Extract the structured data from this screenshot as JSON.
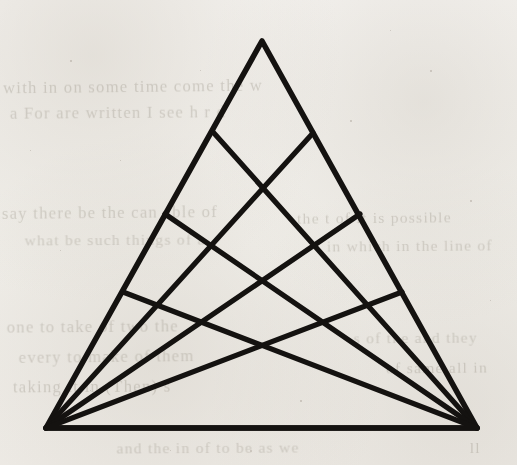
{
  "figure": {
    "title": "Geometric line figure",
    "medium": "scanned book page",
    "ink_color": "#141210",
    "paper_color": "#f3f1ee",
    "canvas": {
      "width": 517,
      "height": 465
    },
    "stroke_width_px": 5.2
  },
  "geometry": {
    "vertices": {
      "apex": {
        "label": "apex",
        "x": 262,
        "y": 41
      },
      "bottom_left": {
        "label": "bottom-left",
        "x": 46,
        "y": 428
      },
      "bottom_right": {
        "label": "bottom-right",
        "x": 477,
        "y": 428
      }
    },
    "outline_path": "M262,41 L477,428 L46,428 Z",
    "left_edge_nodes": [
      {
        "name": "L1",
        "x": 213,
        "y": 132
      },
      {
        "name": "L2",
        "x": 165,
        "y": 214
      },
      {
        "name": "L3",
        "x": 123,
        "y": 292
      }
    ],
    "right_edge_nodes": [
      {
        "name": "R1",
        "x": 313,
        "y": 133
      },
      {
        "name": "R2",
        "x": 360,
        "y": 214
      },
      {
        "name": "R3",
        "x": 402,
        "y": 292
      }
    ],
    "axis_crossings": [
      {
        "name": "X1",
        "x": 262,
        "y": 190
      },
      {
        "name": "X2",
        "x": 262,
        "y": 283
      },
      {
        "name": "X3",
        "x": 261,
        "y": 344
      }
    ],
    "cevians_from_bottom_left": [
      {
        "name": "BL-to-R1",
        "from": "bottom_left",
        "to": "R1",
        "x1": 46,
        "y1": 428,
        "x2": 313,
        "y2": 133
      },
      {
        "name": "BL-to-R2",
        "from": "bottom_left",
        "to": "R2",
        "x1": 46,
        "y1": 428,
        "x2": 360,
        "y2": 214
      },
      {
        "name": "BL-to-R3",
        "from": "bottom_left",
        "to": "R3",
        "x1": 46,
        "y1": 428,
        "x2": 402,
        "y2": 292
      },
      {
        "name": "BL-to-BR",
        "from": "bottom_left",
        "to": "bottom_right",
        "x1": 46,
        "y1": 428,
        "x2": 477,
        "y2": 428
      }
    ],
    "cevians_from_bottom_right": [
      {
        "name": "BR-to-L1",
        "from": "bottom_right",
        "to": "L1",
        "x1": 477,
        "y1": 428,
        "x2": 213,
        "y2": 132
      },
      {
        "name": "BR-to-L2",
        "from": "bottom_right",
        "to": "L2",
        "x1": 477,
        "y1": 428,
        "x2": 165,
        "y2": 214
      },
      {
        "name": "BR-to-L3",
        "from": "bottom_right",
        "to": "L3",
        "x1": 477,
        "y1": 428,
        "x2": 123,
        "y2": 292
      },
      {
        "name": "BR-to-BL",
        "from": "bottom_right",
        "to": "bottom_left",
        "x1": 477,
        "y1": 428,
        "x2": 46,
        "y2": 428
      }
    ],
    "counts": {
      "total_lines": 9,
      "cevians_per_vertex": 3,
      "edge_nodes_per_side": 3
    }
  },
  "background_text": {
    "note": "faint show-through handwriting from the reverse side of the page",
    "lines": [
      {
        "text": "with in on some time come the w",
        "x": 8,
        "y": 78,
        "rotate": -0.6,
        "size": 16
      },
      {
        "text": "a For are written I see h r d",
        "x": 14,
        "y": 104,
        "rotate": -0.4,
        "size": 16
      },
      {
        "text": "say there be the can able of",
        "x": 6,
        "y": 204,
        "rotate": -0.5,
        "size": 16
      },
      {
        "text": "what be such things of a",
        "x": 28,
        "y": 232,
        "rotate": -0.3,
        "size": 15
      },
      {
        "text": "the t of it is possible",
        "x": 300,
        "y": 210,
        "rotate": -0.5,
        "size": 15
      },
      {
        "text": "in which in the line of",
        "x": 330,
        "y": 238,
        "rotate": -0.4,
        "size": 15
      },
      {
        "text": "one to take of two the",
        "x": 10,
        "y": 318,
        "rotate": -0.4,
        "size": 16
      },
      {
        "text": "every to make of them",
        "x": 22,
        "y": 348,
        "rotate": -0.6,
        "size": 16
      },
      {
        "text": "taking it in (Then) s",
        "x": 16,
        "y": 378,
        "rotate": -0.3,
        "size": 16
      },
      {
        "text": "s of the and they",
        "x": 356,
        "y": 330,
        "rotate": -0.4,
        "size": 15
      },
      {
        "text": "of same all in",
        "x": 388,
        "y": 360,
        "rotate": -0.5,
        "size": 15
      },
      {
        "text": "and the in of to be as we",
        "x": 120,
        "y": 440,
        "rotate": -0.3,
        "size": 15
      },
      {
        "text": "ll",
        "x": 470,
        "y": 440,
        "rotate": 0,
        "size": 15
      }
    ]
  },
  "specks": [
    {
      "x": 70,
      "y": 60,
      "size": 2
    },
    {
      "x": 430,
      "y": 70,
      "size": 2
    },
    {
      "x": 120,
      "y": 160,
      "size": 1
    },
    {
      "x": 350,
      "y": 120,
      "size": 2
    },
    {
      "x": 60,
      "y": 250,
      "size": 1
    },
    {
      "x": 470,
      "y": 200,
      "size": 2
    },
    {
      "x": 200,
      "y": 70,
      "size": 1
    },
    {
      "x": 300,
      "y": 400,
      "size": 2
    },
    {
      "x": 90,
      "y": 390,
      "size": 1
    },
    {
      "x": 420,
      "y": 390,
      "size": 1
    },
    {
      "x": 250,
      "y": 450,
      "size": 2
    },
    {
      "x": 30,
      "y": 150,
      "size": 1
    },
    {
      "x": 490,
      "y": 300,
      "size": 1
    },
    {
      "x": 170,
      "y": 450,
      "size": 1
    },
    {
      "x": 390,
      "y": 30,
      "size": 1
    }
  ]
}
